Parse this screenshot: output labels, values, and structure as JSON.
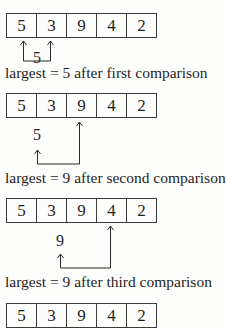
{
  "diagram": {
    "steps": [
      {
        "array": [
          "5",
          "3",
          "9",
          "4",
          "2"
        ],
        "carried_value": "5",
        "caption": "largest = 5 after first comparison"
      },
      {
        "array": [
          "5",
          "3",
          "9",
          "4",
          "2"
        ],
        "carried_value": "5",
        "caption": "largest = 9 after second comparison"
      },
      {
        "array": [
          "5",
          "3",
          "9",
          "4",
          "2"
        ],
        "carried_value": "9",
        "caption": "largest = 9 after third comparison"
      },
      {
        "array": [
          "5",
          "3",
          "9",
          "4",
          "2"
        ]
      }
    ],
    "colors": {
      "line": "#2a2a2a",
      "text": "#1f1f1f",
      "background": "#fdfdfb"
    }
  }
}
